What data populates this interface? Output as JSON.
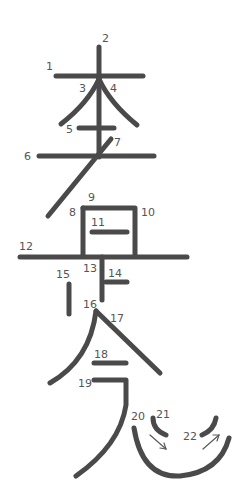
{
  "diagram": {
    "type": "stroke-order",
    "stroke_color": "#4a4a4a",
    "label_color": "#555555",
    "background": "#ffffff",
    "labels": [
      {
        "n": "1",
        "x": 46,
        "y": 70
      },
      {
        "n": "2",
        "x": 102,
        "y": 42
      },
      {
        "n": "3",
        "x": 79,
        "y": 92
      },
      {
        "n": "4",
        "x": 110,
        "y": 92
      },
      {
        "n": "5",
        "x": 66,
        "y": 133
      },
      {
        "n": "6",
        "x": 24,
        "y": 160
      },
      {
        "n": "7",
        "x": 114,
        "y": 146
      },
      {
        "n": "8",
        "x": 69,
        "y": 216
      },
      {
        "n": "9",
        "x": 88,
        "y": 201
      },
      {
        "n": "10",
        "x": 141,
        "y": 216
      },
      {
        "n": "11",
        "x": 91,
        "y": 226
      },
      {
        "n": "12",
        "x": 19,
        "y": 250
      },
      {
        "n": "13",
        "x": 83,
        "y": 272
      },
      {
        "n": "14",
        "x": 108,
        "y": 277
      },
      {
        "n": "15",
        "x": 56,
        "y": 278
      },
      {
        "n": "16",
        "x": 83,
        "y": 308
      },
      {
        "n": "17",
        "x": 110,
        "y": 322
      },
      {
        "n": "18",
        "x": 94,
        "y": 358
      },
      {
        "n": "19",
        "x": 78,
        "y": 387
      },
      {
        "n": "20",
        "x": 131,
        "y": 420
      },
      {
        "n": "21",
        "x": 156,
        "y": 418
      },
      {
        "n": "22",
        "x": 183,
        "y": 440
      }
    ]
  }
}
